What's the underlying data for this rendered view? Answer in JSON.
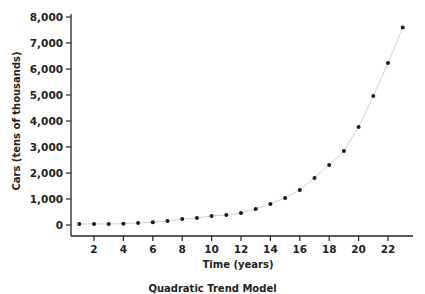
{
  "chart_data": {
    "type": "scatter",
    "title": "Quadratic Trend Model",
    "xlabel": "Time (years)",
    "ylabel": "Cars (tens of thousands)",
    "x": [
      1,
      2,
      3,
      4,
      5,
      6,
      7,
      8,
      9,
      10,
      11,
      12,
      13,
      14,
      15,
      16,
      17,
      18,
      19,
      20,
      21,
      22,
      23
    ],
    "series": [
      {
        "name": "Cars",
        "marker": "dot",
        "connected_by_faint_line": true,
        "values": [
          40,
          40,
          40,
          50,
          80,
          110,
          150,
          230,
          270,
          350,
          380,
          460,
          620,
          810,
          1040,
          1350,
          1810,
          2310,
          2850,
          3770,
          4960,
          6230,
          7600
        ]
      }
    ],
    "xlim": [
      0.5,
      24
    ],
    "ylim": [
      -400,
      8000
    ],
    "x_ticks": [
      2,
      4,
      6,
      8,
      10,
      12,
      14,
      16,
      18,
      20,
      22
    ],
    "y_ticks": [
      0,
      1000,
      2000,
      3000,
      4000,
      5000,
      6000,
      7000,
      8000
    ],
    "y_tick_labels": [
      "0",
      "1,000",
      "2,000",
      "3,000",
      "4,000",
      "5,000",
      "6,000",
      "7,000",
      "8,000"
    ],
    "grid": false,
    "legend": null,
    "colors": {
      "points": "#1a1a1a",
      "line": "#d0d0d0",
      "axis": "#222222"
    }
  }
}
